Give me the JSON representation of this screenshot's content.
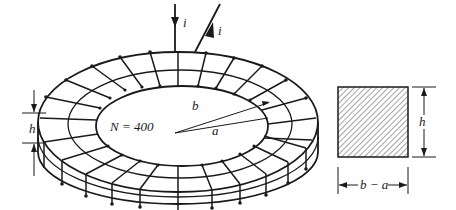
{
  "figure": {
    "toroid": {
      "turns_label": "N = 400",
      "current_in_label": "i",
      "current_out_label": "i",
      "inner_radius_label": "a",
      "outer_radius_label": "b",
      "height_label": "h"
    },
    "cross_section": {
      "height_label": "h",
      "width_label": "b − a"
    }
  }
}
